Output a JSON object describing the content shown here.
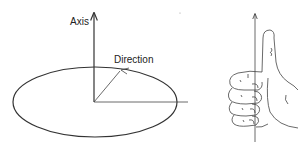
{
  "diagram": {
    "labels": {
      "axis": "Axis",
      "direction": "Direction"
    },
    "figures": [
      {
        "name": "rotation-ellipse-diagram",
        "description": "Ellipse representing rotation plane with vertical axis arrow and direction arrow"
      },
      {
        "name": "right-hand-thumb-diagram",
        "description": "Right hand with curled fingers and thumb pointing up along an axis arrow"
      }
    ],
    "colors": {
      "line": "#333333",
      "background": "#ffffff"
    }
  }
}
